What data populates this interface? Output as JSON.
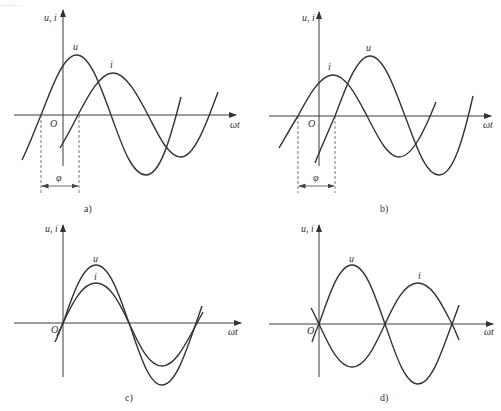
{
  "figure": {
    "top_fragment": "……",
    "panels": [
      {
        "id": "a",
        "caption": "a)",
        "y_axis_label": "u, i",
        "x_axis_label": "ωt",
        "origin_label": "O",
        "curves": [
          {
            "name": "u",
            "label": "u",
            "relation": "leads i by φ",
            "relative_amplitude": 1.0
          },
          {
            "name": "i",
            "label": "i",
            "relative_amplitude": 0.7
          }
        ],
        "phase_label": "φ",
        "description": "Voltage u leads current i by phase angle φ"
      },
      {
        "id": "b",
        "caption": "b)",
        "y_axis_label": "u, i",
        "x_axis_label": "ωt",
        "origin_label": "O",
        "curves": [
          {
            "name": "i",
            "label": "i",
            "relation": "leads u by φ",
            "relative_amplitude": 0.7
          },
          {
            "name": "u",
            "label": "u",
            "relative_amplitude": 1.0
          }
        ],
        "phase_label": "φ",
        "description": "Current i leads voltage u by phase angle φ"
      },
      {
        "id": "c",
        "caption": "c)",
        "y_axis_label": "u, i",
        "x_axis_label": "ωt",
        "origin_label": "O",
        "curves": [
          {
            "name": "u",
            "label": "u",
            "relative_amplitude": 1.0
          },
          {
            "name": "i",
            "label": "i",
            "relative_amplitude": 0.7
          }
        ],
        "description": "u and i in phase"
      },
      {
        "id": "d",
        "caption": "d)",
        "y_axis_label": "u, i",
        "x_axis_label": "ωt",
        "origin_label": "O",
        "curves": [
          {
            "name": "u",
            "label": "u",
            "relative_amplitude": 1.0
          },
          {
            "name": "i",
            "label": "i",
            "relative_amplitude": 0.7
          }
        ],
        "description": "u and i in antiphase (180° out of phase)"
      }
    ]
  }
}
